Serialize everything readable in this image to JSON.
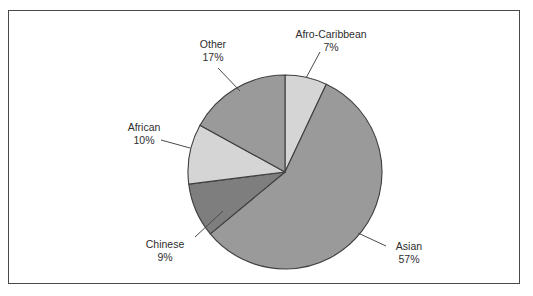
{
  "figure": {
    "background": "#ffffff",
    "border_color": "#4a4a4a"
  },
  "chart_data": {
    "type": "pie",
    "title": "",
    "subtitle": "",
    "xlabel": "",
    "ylabel": "",
    "legend_position": "none",
    "labels_position": "outside-with-leader-lines",
    "start_angle_deg": 0,
    "direction": "clockwise",
    "units": "percent",
    "total": 100,
    "categories": [
      "Afro-Caribbean",
      "Asian",
      "Chinese",
      "African",
      "Other"
    ],
    "values": [
      7,
      57,
      9,
      10,
      17
    ],
    "value_labels": [
      "7%",
      "57%",
      "9%",
      "10%",
      "17%"
    ],
    "colors": [
      "#d5d5d5",
      "#9a9a9a",
      "#7e7e7e",
      "#d5d5d5",
      "#9a9a9a"
    ],
    "slices": [
      {
        "name": "Afro-Caribbean",
        "value": 7,
        "value_label": "7%",
        "color": "#d5d5d5",
        "start_angle_deg": 0,
        "end_angle_deg": 25.2,
        "label_line1": "Afro-Caribbean",
        "label_line2": "7%"
      },
      {
        "name": "Asian",
        "value": 57,
        "value_label": "57%",
        "color": "#9a9a9a",
        "start_angle_deg": 25.2,
        "end_angle_deg": 230.4,
        "label_line1": "Asian",
        "label_line2": "57%"
      },
      {
        "name": "Chinese",
        "value": 9,
        "value_label": "9%",
        "color": "#7e7e7e",
        "start_angle_deg": 230.4,
        "end_angle_deg": 262.8,
        "label_line1": "Chinese",
        "label_line2": "9%"
      },
      {
        "name": "African",
        "value": 10,
        "value_label": "10%",
        "color": "#d5d5d5",
        "start_angle_deg": 262.8,
        "end_angle_deg": 298.8,
        "label_line1": "African",
        "label_line2": "10%"
      },
      {
        "name": "Other",
        "value": 17,
        "value_label": "17%",
        "color": "#9a9a9a",
        "start_angle_deg": 298.8,
        "end_angle_deg": 360,
        "label_line1": "Other",
        "label_line2": "17%"
      }
    ]
  }
}
